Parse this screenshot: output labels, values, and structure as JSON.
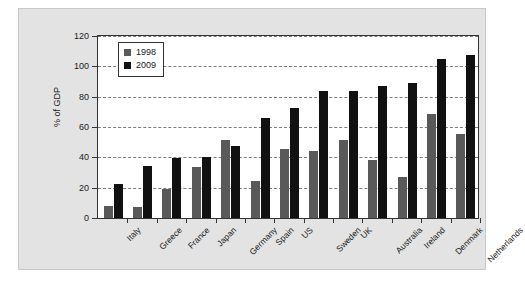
{
  "chart_data": {
    "type": "bar",
    "title": "",
    "xlabel": "",
    "ylabel": "% of GDP",
    "ylim": [
      0,
      120
    ],
    "yticks": [
      0,
      20,
      40,
      60,
      80,
      100,
      120
    ],
    "grid": true,
    "legend_position": "top-left",
    "categories": [
      "Italy",
      "Greece",
      "France",
      "Japan",
      "Germany",
      "Spain",
      "US",
      "Sweden",
      "UK",
      "Australia",
      "Ireland",
      "Denmark",
      "Netherlands"
    ],
    "series": [
      {
        "name": "1998",
        "color": "#595959",
        "values": [
          8,
          7,
          19,
          33,
          51,
          24,
          45,
          44,
          51,
          38,
          27,
          68,
          55
        ]
      },
      {
        "name": "2009",
        "color": "#111111",
        "values": [
          22,
          34,
          39,
          40,
          47,
          65,
          72,
          83,
          83,
          86,
          88,
          104,
          106
        ]
      }
    ]
  },
  "colors": {
    "background": "#ffffff",
    "panel": "#e3e3e3",
    "plot_background": "#ffffff",
    "axis": "#333333",
    "gridline": "#7d7d7d",
    "series_1998": "#595959",
    "series_2009": "#111111"
  }
}
